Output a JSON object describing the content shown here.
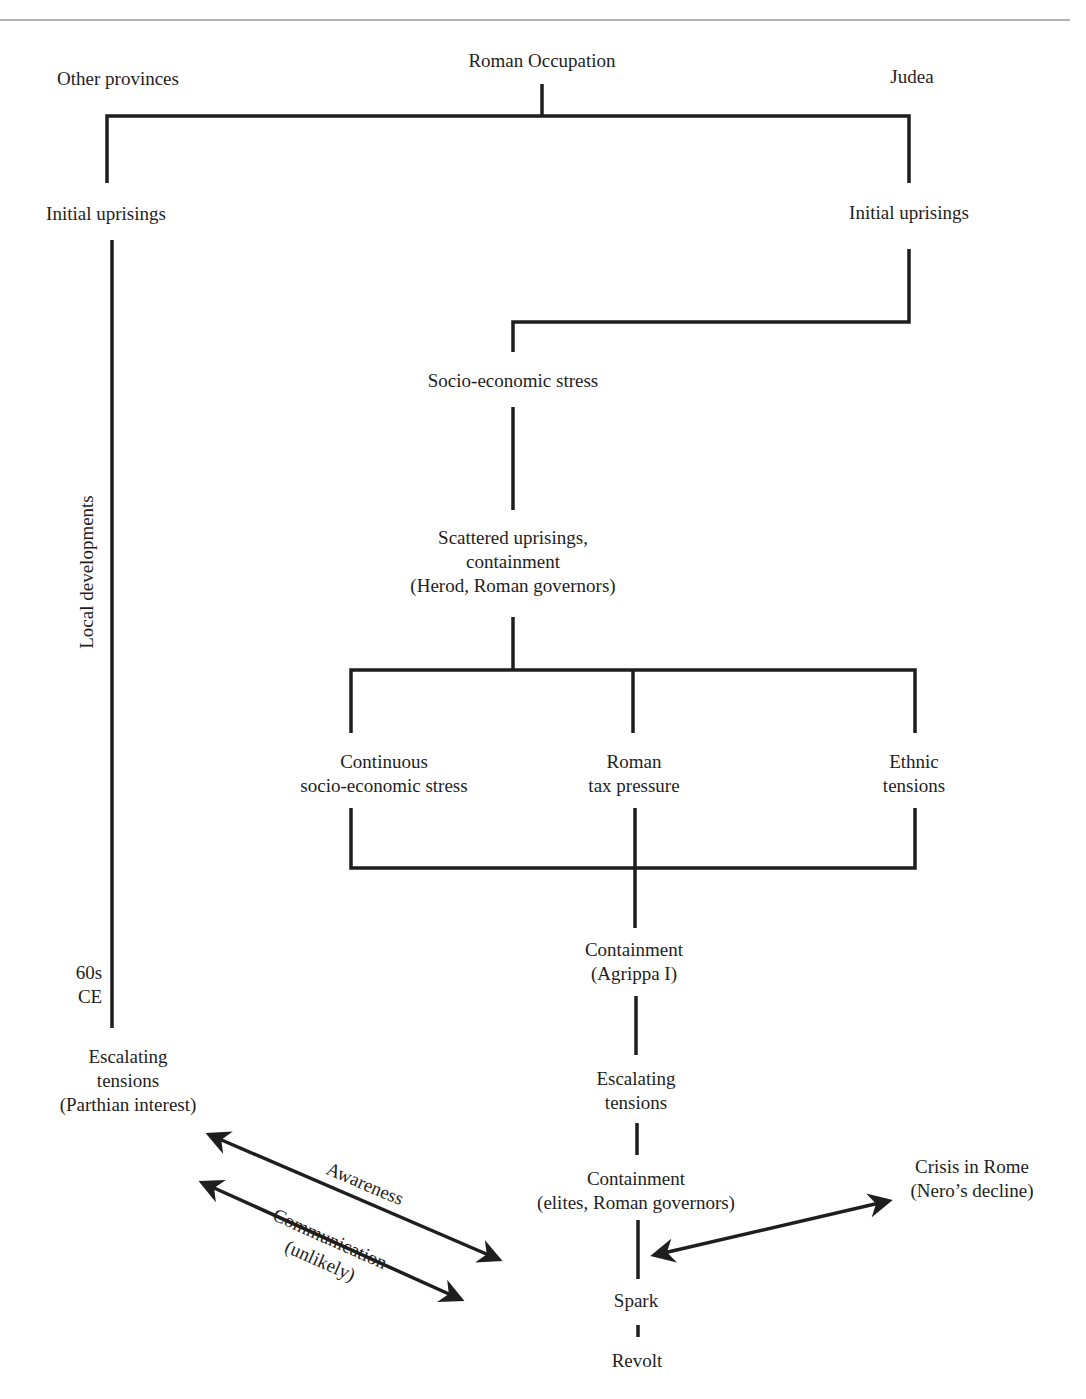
{
  "diagram": {
    "type": "flowchart",
    "colors": {
      "line": "#1e1e1e",
      "rule": "#9a9a9a",
      "background": "#ffffff"
    },
    "nodes": {
      "roman_occupation": "Roman Occupation",
      "other_provinces": "Other provinces",
      "judea": "Judea",
      "initial_uprisings_left": "Initial uprisings",
      "initial_uprisings_right": "Initial uprisings",
      "socio_economic_stress": "Socio-economic stress",
      "scattered_uprisings": "Scattered uprisings,\ncontainment\n(Herod, Roman governors)",
      "continuous_stress": "Continuous\nsocio-economic stress",
      "roman_tax": "Roman\ntax pressure",
      "ethnic_tensions": "Ethnic\ntensions",
      "containment_agrippa": "Containment\n(Agrippa I)",
      "escalating_judea": "Escalating\ntensions",
      "containment_elites": "Containment\n(elites, Roman governors)",
      "spark": "Spark",
      "revolt": "Revolt",
      "escalating_other": "Escalating\ntensions\n(Parthian interest)",
      "crisis_rome": "Crisis in Rome\n(Nero’s decline)",
      "period_60s": "60s\nCE"
    },
    "edge_labels": {
      "local_developments": "Local developments",
      "awareness": "Awareness",
      "communication": "Communication\n(unlikely)"
    }
  }
}
